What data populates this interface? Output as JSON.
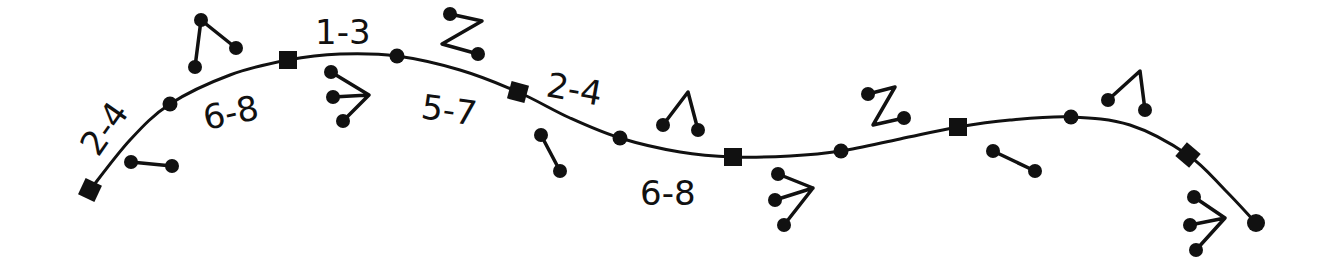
{
  "diagram": {
    "width": 1332,
    "height": 276,
    "ink_color": "#111111",
    "background": "#ffffff",
    "path_points": [
      [
        90,
        190
      ],
      [
        130,
        140
      ],
      [
        170,
        104
      ],
      [
        230,
        75
      ],
      [
        288,
        60
      ],
      [
        340,
        54
      ],
      [
        397,
        56
      ],
      [
        460,
        70
      ],
      [
        518,
        92
      ],
      [
        570,
        118
      ],
      [
        620,
        138
      ],
      [
        680,
        152
      ],
      [
        733,
        157
      ],
      [
        790,
        156
      ],
      [
        841,
        151
      ],
      [
        900,
        139
      ],
      [
        958,
        127
      ],
      [
        1010,
        120
      ],
      [
        1071,
        117
      ],
      [
        1130,
        125
      ],
      [
        1188,
        155
      ],
      [
        1225,
        190
      ],
      [
        1256,
        223
      ]
    ],
    "nodes": [
      {
        "type": "square",
        "x": 90,
        "y": 190,
        "rot": 25
      },
      {
        "type": "dot",
        "x": 170,
        "y": 104
      },
      {
        "type": "square",
        "x": 288,
        "y": 60,
        "rot": 0
      },
      {
        "type": "dot",
        "x": 397,
        "y": 56
      },
      {
        "type": "square",
        "x": 518,
        "y": 92,
        "rot": 15
      },
      {
        "type": "dot",
        "x": 620,
        "y": 138
      },
      {
        "type": "square",
        "x": 733,
        "y": 157,
        "rot": 0
      },
      {
        "type": "dot",
        "x": 841,
        "y": 151
      },
      {
        "type": "square",
        "x": 958,
        "y": 127,
        "rot": 0
      },
      {
        "type": "dot",
        "x": 1071,
        "y": 117
      },
      {
        "type": "square",
        "x": 1188,
        "y": 155,
        "rot": 40
      },
      {
        "type": "end-dot",
        "x": 1256,
        "y": 223
      }
    ],
    "labels": [
      {
        "text": "2-4",
        "x": 98,
        "y": 158,
        "rot": -55
      },
      {
        "text": "6-8",
        "x": 206,
        "y": 130,
        "rot": -12
      },
      {
        "text": "1-3",
        "x": 315,
        "y": 44,
        "rot": 0
      },
      {
        "text": "5-7",
        "x": 420,
        "y": 118,
        "rot": 8
      },
      {
        "text": "2-4",
        "x": 545,
        "y": 96,
        "rot": 10
      },
      {
        "text": "6-8",
        "x": 640,
        "y": 205,
        "rot": 0
      }
    ],
    "glyphs": [
      {
        "name": "single-stick",
        "points": [
          [
            131,
            162
          ],
          [
            172,
            166
          ]
        ],
        "balls": [
          [
            131,
            162
          ],
          [
            172,
            166
          ]
        ]
      },
      {
        "name": "hook-stick",
        "points": [
          [
            195,
            67
          ],
          [
            201,
            20
          ],
          [
            236,
            48
          ]
        ],
        "balls": [
          [
            195,
            67
          ],
          [
            201,
            20
          ],
          [
            236,
            48
          ]
        ]
      },
      {
        "name": "triple-fork",
        "points": [
          [
            331,
            72
          ],
          [
            369,
            95
          ],
          [
            333,
            97
          ],
          [
            369,
            95
          ],
          [
            343,
            121
          ]
        ],
        "balls": [
          [
            331,
            72
          ],
          [
            333,
            97
          ],
          [
            343,
            121
          ]
        ]
      },
      {
        "name": "z-stick",
        "points": [
          [
            450,
            14
          ],
          [
            482,
            21
          ],
          [
            442,
            44
          ],
          [
            478,
            54
          ]
        ],
        "balls": [
          [
            450,
            14
          ],
          [
            478,
            54
          ]
        ]
      },
      {
        "name": "single-stick",
        "points": [
          [
            541,
            135
          ],
          [
            560,
            171
          ]
        ],
        "balls": [
          [
            541,
            135
          ],
          [
            560,
            171
          ]
        ]
      },
      {
        "name": "hook-stick",
        "points": [
          [
            663,
            125
          ],
          [
            688,
            92
          ],
          [
            698,
            130
          ]
        ],
        "balls": [
          [
            663,
            125
          ],
          [
            698,
            130
          ]
        ]
      },
      {
        "name": "triple-fork",
        "points": [
          [
            778,
            174
          ],
          [
            813,
            188
          ],
          [
            775,
            200
          ],
          [
            813,
            188
          ],
          [
            784,
            225
          ]
        ],
        "balls": [
          [
            778,
            174
          ],
          [
            775,
            200
          ],
          [
            784,
            225
          ]
        ]
      },
      {
        "name": "z-stick",
        "points": [
          [
            868,
            94
          ],
          [
            895,
            87
          ],
          [
            873,
            125
          ],
          [
            904,
            118
          ]
        ],
        "balls": [
          [
            868,
            94
          ],
          [
            904,
            118
          ]
        ]
      },
      {
        "name": "single-stick",
        "points": [
          [
            993,
            151
          ],
          [
            1035,
            171
          ]
        ],
        "balls": [
          [
            993,
            151
          ],
          [
            1035,
            171
          ]
        ]
      },
      {
        "name": "hook-stick",
        "points": [
          [
            1108,
            100
          ],
          [
            1140,
            71
          ],
          [
            1145,
            110
          ]
        ],
        "balls": [
          [
            1108,
            100
          ],
          [
            1145,
            110
          ]
        ]
      },
      {
        "name": "triple-fork",
        "points": [
          [
            1194,
            197
          ],
          [
            1225,
            218
          ],
          [
            1190,
            225
          ],
          [
            1225,
            218
          ],
          [
            1196,
            250
          ]
        ],
        "balls": [
          [
            1194,
            197
          ],
          [
            1190,
            225
          ],
          [
            1196,
            250
          ]
        ]
      }
    ]
  }
}
